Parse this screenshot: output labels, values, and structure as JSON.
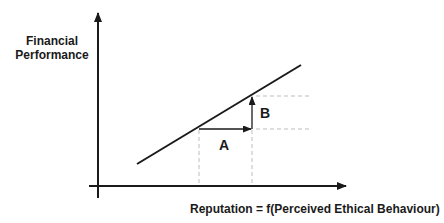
{
  "diagram": {
    "y_axis_label_line1": "Financial",
    "y_axis_label_line2": "Performance",
    "x_axis_label": "Reputation = f(Perceived Ethical Behaviour)",
    "label_a": "A",
    "label_b": "B",
    "colors": {
      "line": "#1a1a1a",
      "dashed": "#bdbdbd",
      "background": "#ffffff"
    }
  }
}
